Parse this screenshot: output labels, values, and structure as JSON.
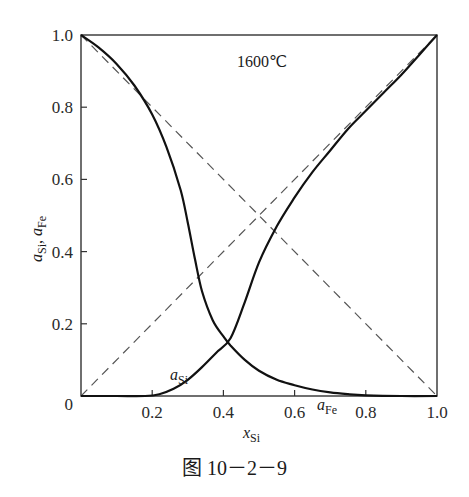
{
  "caption": "图 10－2－9",
  "chart_data": {
    "type": "line",
    "title": "1600℃",
    "xlabel": "x_Si",
    "ylabel": "a_Si, a_Fe",
    "xlim": [
      0,
      1.0
    ],
    "ylim": [
      0,
      1.0
    ],
    "grid": false,
    "x_ticks": [
      "0.2",
      "0.4",
      "0.6",
      "0.8",
      "1.0"
    ],
    "y_ticks": [
      "0",
      "0.2",
      "0.4",
      "0.6",
      "0.8",
      "1.0"
    ],
    "origin_label": "0",
    "annotations": [
      {
        "text": "1600℃",
        "x": 0.45,
        "y": 0.92
      },
      {
        "text": "a_Si",
        "x": 0.26,
        "y": 0.06
      },
      {
        "text": "a_Fe",
        "x": 0.62,
        "y": 0.05
      }
    ],
    "series": [
      {
        "name": "a_Si",
        "style": "solid",
        "x": [
          0.0,
          0.1,
          0.18,
          0.22,
          0.26,
          0.3,
          0.34,
          0.38,
          0.42,
          0.46,
          0.5,
          0.55,
          0.6,
          0.65,
          0.7,
          0.75,
          0.8,
          0.85,
          0.9,
          0.95,
          1.0
        ],
        "y": [
          0.0,
          0.0,
          0.0,
          0.005,
          0.02,
          0.045,
          0.08,
          0.12,
          0.16,
          0.26,
          0.37,
          0.47,
          0.55,
          0.62,
          0.68,
          0.74,
          0.79,
          0.84,
          0.89,
          0.945,
          1.0
        ]
      },
      {
        "name": "a_Fe",
        "style": "solid",
        "x": [
          0.0,
          0.05,
          0.1,
          0.15,
          0.2,
          0.24,
          0.28,
          0.3,
          0.32,
          0.34,
          0.37,
          0.4,
          0.42,
          0.46,
          0.5,
          0.55,
          0.6,
          0.65,
          0.7,
          0.75,
          0.8,
          0.9,
          1.0
        ],
        "y": [
          1.0,
          0.965,
          0.92,
          0.86,
          0.78,
          0.69,
          0.57,
          0.48,
          0.38,
          0.29,
          0.21,
          0.165,
          0.14,
          0.1,
          0.07,
          0.045,
          0.03,
          0.018,
          0.01,
          0.005,
          0.002,
          0.0,
          0.0
        ]
      },
      {
        "name": "ideal a_Si (Raoult)",
        "style": "dashed",
        "x": [
          0,
          1
        ],
        "y": [
          0,
          1
        ]
      },
      {
        "name": "ideal a_Fe (Raoult)",
        "style": "dashed",
        "x": [
          0,
          1
        ],
        "y": [
          1,
          0
        ]
      }
    ]
  }
}
